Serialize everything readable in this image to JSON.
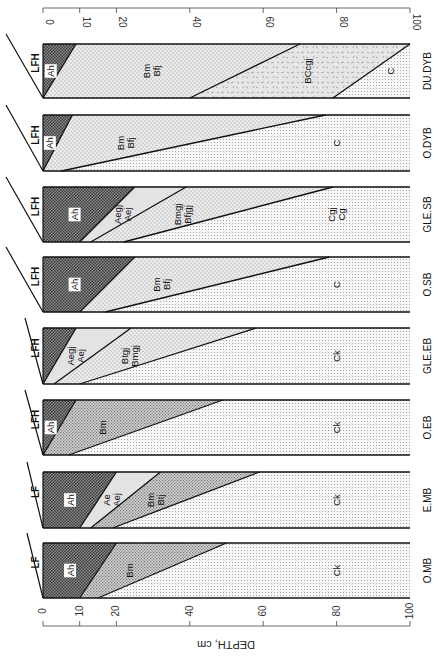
{
  "figure": {
    "axis_title": "DEPTH, cm",
    "axis_ticks": [
      "0",
      "10",
      "20",
      "40",
      "60",
      "80",
      "100"
    ],
    "axis_tick_values": [
      0,
      10,
      20,
      40,
      60,
      80,
      100
    ],
    "orientation": "rotated 90° clockwise; depth increases left→right"
  },
  "profiles": [
    {
      "name": "DU.DYB",
      "litter": "LFH",
      "horizons": [
        {
          "label": "Ah",
          "top": [
            0,
            0
          ],
          "bottom": [
            9,
            0
          ],
          "fill": "dark"
        },
        {
          "label": "Bm\nBfj",
          "top": [
            9,
            0
          ],
          "bottom": [
            70,
            40
          ],
          "fill": "light"
        },
        {
          "label": "BCcgj",
          "top": [
            70,
            40
          ],
          "bottom": [
            100,
            79
          ],
          "fill": "swirl"
        },
        {
          "label": "C",
          "top": [
            100,
            79
          ],
          "bottom": [
            100,
            100
          ],
          "fill": "grid"
        }
      ]
    },
    {
      "name": "O.DYB",
      "litter": "LFH",
      "horizons": [
        {
          "label": "Ah",
          "top": [
            0,
            0
          ],
          "bottom": [
            8,
            0
          ],
          "fill": "dark"
        },
        {
          "label": "Bm\nBfj",
          "top": [
            8,
            0
          ],
          "bottom": [
            77,
            5
          ],
          "fill": "light"
        },
        {
          "label": "C",
          "top": [
            77,
            5
          ],
          "bottom": [
            100,
            100
          ],
          "fill": "grid"
        }
      ]
    },
    {
      "name": "GLE.SB",
      "litter": "LFH",
      "horizons": [
        {
          "label": "Ah",
          "top": [
            0,
            0
          ],
          "bottom": [
            25,
            10
          ],
          "fill": "dark"
        },
        {
          "label": "Aegj\nAej",
          "top": [
            25,
            10
          ],
          "bottom": [
            39,
            13
          ],
          "fill": "pale"
        },
        {
          "label": "Bmgj\nBfjgj",
          "top": [
            39,
            13
          ],
          "bottom": [
            79,
            22
          ],
          "fill": "light"
        },
        {
          "label": "Cgj\nCg",
          "top": [
            79,
            22
          ],
          "bottom": [
            100,
            100
          ],
          "fill": "grid"
        }
      ]
    },
    {
      "name": "O.SB",
      "litter": "LFH",
      "horizons": [
        {
          "label": "Ah",
          "top": [
            0,
            0
          ],
          "bottom": [
            25,
            10
          ],
          "fill": "dark"
        },
        {
          "label": "Bm\nBfj",
          "top": [
            25,
            10
          ],
          "bottom": [
            78,
            17
          ],
          "fill": "light"
        },
        {
          "label": "C",
          "top": [
            78,
            17
          ],
          "bottom": [
            100,
            100
          ],
          "fill": "grid"
        }
      ]
    },
    {
      "name": "GLE.EB",
      "litter": "LFH",
      "horizons": [
        {
          "label": "",
          "top": [
            0,
            0
          ],
          "bottom": [
            9,
            0
          ],
          "fill": "dark"
        },
        {
          "label": "Aegj\nAej",
          "top": [
            9,
            0
          ],
          "bottom": [
            24,
            3
          ],
          "fill": "pale"
        },
        {
          "label": "Btgj\nBmgj",
          "top": [
            24,
            3
          ],
          "bottom": [
            58,
            10
          ],
          "fill": "light"
        },
        {
          "label": "Ck",
          "top": [
            58,
            10
          ],
          "bottom": [
            100,
            100
          ],
          "fill": "grid"
        }
      ]
    },
    {
      "name": "O.EB",
      "litter": "LFH",
      "horizons": [
        {
          "label": "Ah",
          "top": [
            0,
            0
          ],
          "bottom": [
            9,
            0
          ],
          "fill": "dark"
        },
        {
          "label": "Bm",
          "top": [
            9,
            0
          ],
          "bottom": [
            49,
            7
          ],
          "fill": "medium"
        },
        {
          "label": "Ck",
          "top": [
            49,
            7
          ],
          "bottom": [
            100,
            100
          ],
          "fill": "grid"
        }
      ]
    },
    {
      "name": "E.MB",
      "litter": "LF",
      "horizons": [
        {
          "label": "Ah",
          "top": [
            0,
            0
          ],
          "bottom": [
            20,
            10
          ],
          "fill": "dark"
        },
        {
          "label": "Ae\nAej",
          "top": [
            20,
            10
          ],
          "bottom": [
            32,
            13
          ],
          "fill": "pale"
        },
        {
          "label": "Bm\nBtj",
          "top": [
            32,
            13
          ],
          "bottom": [
            59,
            19
          ],
          "fill": "medium"
        },
        {
          "label": "Ck",
          "top": [
            59,
            19
          ],
          "bottom": [
            100,
            100
          ],
          "fill": "grid"
        }
      ]
    },
    {
      "name": "O.MB",
      "litter": "LF",
      "horizons": [
        {
          "label": "Ah",
          "top": [
            0,
            0
          ],
          "bottom": [
            20,
            10
          ],
          "fill": "dark"
        },
        {
          "label": "Bm",
          "top": [
            20,
            10
          ],
          "bottom": [
            50,
            15
          ],
          "fill": "medium"
        },
        {
          "label": "Ck",
          "top": [
            50,
            15
          ],
          "bottom": [
            100,
            100
          ],
          "fill": "grid"
        }
      ]
    }
  ]
}
